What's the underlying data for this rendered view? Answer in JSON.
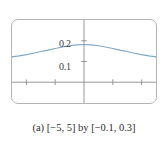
{
  "figure": {
    "caption": "(a) [−5, 5] by [−0.1, 0.3]",
    "caption_label": "(a)",
    "x_window": "[−5, 5]",
    "y_window": "[−0.1, 0.3]",
    "connector_word": "by"
  },
  "colors": {
    "curve": "#7ea9c4",
    "axis": "#8c8c8c",
    "frame": "#b4b4b4",
    "background": "#ffffff",
    "text": "#2b2b2b"
  },
  "axis_labels": {
    "y_upper": "0.2",
    "y_lower": "0.1"
  },
  "chart_data": {
    "type": "line",
    "title": "",
    "subtitle": "",
    "xlabel": "",
    "ylabel": "",
    "xlim": [
      -5,
      5
    ],
    "ylim": [
      -0.1,
      0.3
    ],
    "grid": false,
    "legend": null,
    "legend_position": "none",
    "xticks": [
      -4,
      -2,
      2,
      4
    ],
    "xtick_labels": [
      "",
      "",
      "",
      ""
    ],
    "yticks": [
      0.1,
      0.2
    ],
    "ytick_labels": [
      "0.1",
      "0.2"
    ],
    "annotations": [],
    "series": [
      {
        "name": "curve",
        "color": "#7ea9c4",
        "x": [
          -5,
          -4.5,
          -4,
          -3.5,
          -3,
          -2.5,
          -2,
          -1.5,
          -1,
          -0.5,
          0,
          0.5,
          1,
          1.5,
          2,
          2.5,
          3,
          3.5,
          4,
          4.5,
          5
        ],
        "y": [
          0.122,
          0.127,
          0.133,
          0.14,
          0.148,
          0.155,
          0.163,
          0.17,
          0.176,
          0.18,
          0.182,
          0.18,
          0.176,
          0.17,
          0.163,
          0.155,
          0.148,
          0.14,
          0.133,
          0.127,
          0.122
        ]
      }
    ]
  }
}
